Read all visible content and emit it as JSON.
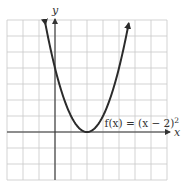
{
  "chart_data": {
    "type": "line",
    "title": "",
    "function": "f(x) = (x - 2)^2",
    "xlabel": "x",
    "ylabel": "y",
    "xlim": [
      -3,
      7
    ],
    "ylim": [
      -3,
      7
    ],
    "grid": true,
    "grid_step": 1,
    "tick_labels": false,
    "annotation": {
      "text_prefix": "f(x) = (x − 2)",
      "exponent": "2",
      "position": [
        3.1,
        0.3
      ]
    },
    "series": [
      {
        "name": "f(x) = (x - 2)^2",
        "x": [
          -0.6,
          -0.5,
          0,
          0.5,
          1,
          1.5,
          2,
          2.5,
          3,
          3.5,
          4,
          4.5,
          4.6
        ],
        "y": [
          6.76,
          6.25,
          4,
          2.25,
          1,
          0.25,
          0,
          0.25,
          1,
          2.25,
          4,
          6.25,
          6.76
        ]
      }
    ],
    "features": {
      "vertex": [
        2,
        0
      ],
      "y_intercept": [
        0,
        4
      ],
      "arrows_on_ends": true
    },
    "colors": {
      "grid": "#c8c8c8",
      "axis": "#333333",
      "curve": "#2b2b2b",
      "background": "#ffffff"
    }
  }
}
